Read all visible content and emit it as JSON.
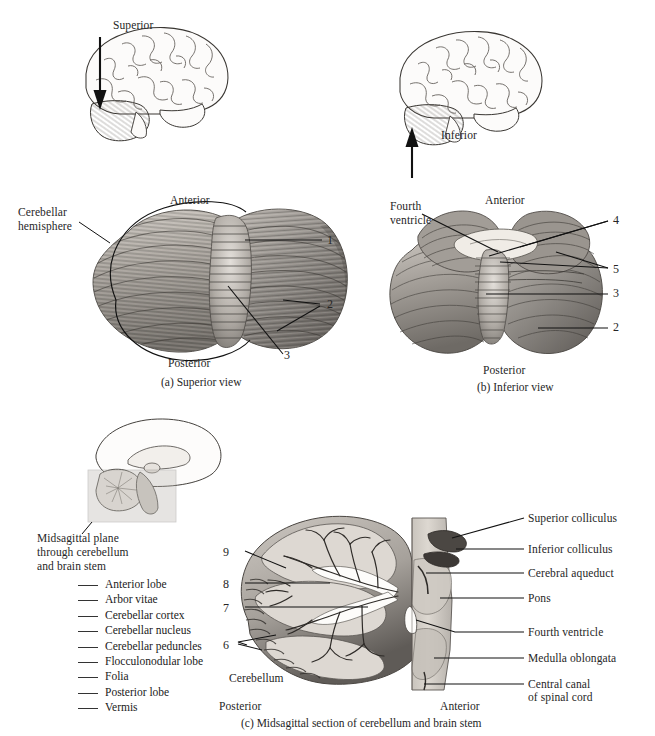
{
  "header": {
    "ghost_text": ""
  },
  "figure": {
    "panels": [
      {
        "id": "a",
        "caption": "(a) Superior view",
        "orientation_top": "Anterior",
        "orientation_bottom": "Posterior",
        "inset_direction": "Superior",
        "text_labels": [
          "Cerebellar",
          "hemisphere"
        ],
        "number_labels": [
          "1",
          "2",
          "3"
        ]
      },
      {
        "id": "b",
        "caption": "(b) Inferior view",
        "orientation_top": "Anterior",
        "orientation_bottom": "Posterior",
        "inset_direction": "Inferior",
        "text_labels": [
          "Fourth",
          "ventricle"
        ],
        "number_labels": [
          "4",
          "5",
          "3",
          "2"
        ]
      },
      {
        "id": "c",
        "caption": "(c) Midsagittal section of cerebellum and brain stem",
        "orientation_left": "Posterior",
        "orientation_right": "Anterior",
        "inset_caption": [
          "Midsagittal plane",
          "through cerebellum",
          "and brain stem"
        ],
        "structure_label": "Cerebellum",
        "number_labels": [
          "9",
          "8",
          "7",
          "6"
        ],
        "right_labels": [
          "Superior colliculus",
          "Inferior colliculus",
          "Cerebral aqueduct",
          "Pons",
          "Fourth ventricle",
          "Medulla oblongata",
          "Central canal",
          "of spinal cord"
        ]
      }
    ],
    "word_bank": [
      "Anterior lobe",
      "Arbor vitae",
      "Cerebellar cortex",
      "Cerebellar nucleus",
      "Cerebellar peduncles",
      "Flocculonodular lobe",
      "Folia",
      "Posterior lobe",
      "Vermis"
    ]
  },
  "colors": {
    "ink": "#262626",
    "leader": "#111111",
    "tissue_light": "#d8d4cf",
    "tissue_mid": "#9e9a95",
    "tissue_dark": "#5c5853",
    "paper": "#ffffff"
  },
  "labels": {
    "superior": "Superior",
    "inferior": "Inferior",
    "anterior": "Anterior",
    "posterior": "Posterior",
    "cerebellar_hemisphere_l1": "Cerebellar",
    "cerebellar_hemisphere_l2": "hemisphere",
    "fourth_ventricle_l1": "Fourth",
    "fourth_ventricle_l2": "ventricle",
    "cerebellum": "Cerebellum",
    "midsag_l1": "Midsagittal plane",
    "midsag_l2": "through cerebellum",
    "midsag_l3": "and brain stem",
    "n1": "1",
    "n2": "2",
    "n3": "3",
    "n4": "4",
    "n5": "5",
    "n6": "6",
    "n7": "7",
    "n8": "8",
    "n9": "9",
    "r1": "Superior colliculus",
    "r2": "Inferior colliculus",
    "r3": "Cerebral aqueduct",
    "r4": "Pons",
    "r5": "Fourth ventricle",
    "r6": "Medulla oblongata",
    "r7a": "Central canal",
    "r7b": "of spinal cord",
    "cap_a": "(a) Superior view",
    "cap_b": "(b) Inferior view",
    "cap_c": "(c) Midsagittal section of cerebellum and brain stem",
    "a2_anterior": "Anterior",
    "a2_posterior": "Posterior",
    "b2_anterior": "Anterior",
    "b2_posterior": "Posterior",
    "c_posterior": "Posterior",
    "c_anterior": "Anterior"
  }
}
